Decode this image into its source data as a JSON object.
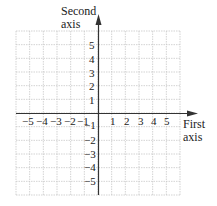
{
  "diagram": {
    "type": "coordinate-plane",
    "x_axis": {
      "title_line1": "First",
      "title_line2": "axis",
      "min": -5,
      "max": 5
    },
    "y_axis": {
      "title_line1": "Second",
      "title_line2": "axis",
      "min": -5,
      "max": 5
    },
    "x_tick_labels": [
      "−5",
      "−4",
      "−3",
      "−2",
      "−1",
      "1",
      "2",
      "3",
      "4",
      "5"
    ],
    "y_tick_labels": [
      "5",
      "4",
      "3",
      "2",
      "1",
      "−1",
      "−2",
      "−3",
      "−4",
      "−5"
    ],
    "grid": {
      "columns": 12,
      "rows": 12,
      "color": "#c8c8c8"
    },
    "axis_color": "#333333"
  }
}
